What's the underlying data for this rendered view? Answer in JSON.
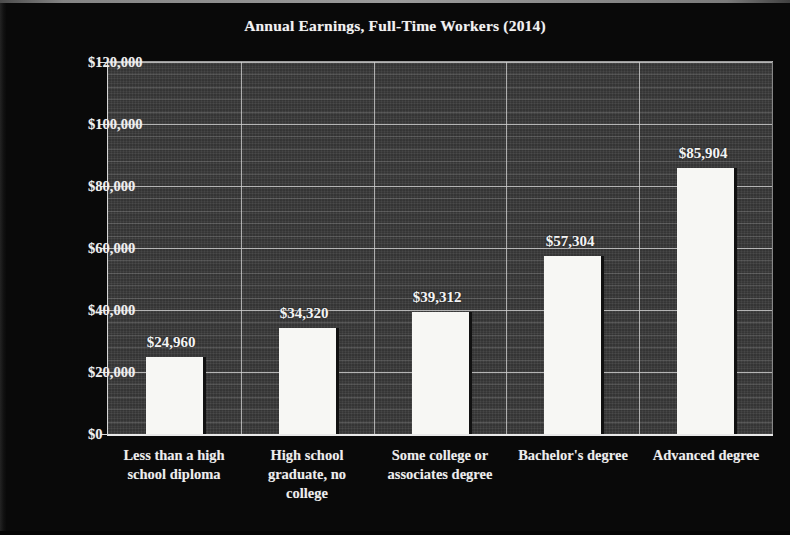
{
  "chart_data": {
    "type": "bar",
    "title": "Annual Earnings, Full-Time Workers (2014)",
    "xlabel": "",
    "ylabel": "",
    "categories": [
      "Less than a high school diploma",
      "High school graduate, no college",
      "Some college or associates degree",
      "Bachelor's degree",
      "Advanced degree"
    ],
    "values": [
      24960,
      34320,
      39312,
      57304,
      85904
    ],
    "data_labels": [
      "$24,960",
      "$34,320",
      "$39,312",
      "$57,304",
      "$85,904"
    ],
    "ylim": [
      0,
      120000
    ],
    "ytick_values": [
      0,
      20000,
      40000,
      60000,
      80000,
      100000,
      120000
    ],
    "ytick_labels": [
      "$0",
      "$20,000",
      "$40,000",
      "$60,000",
      "$80,000",
      "$100,000",
      "$120,000"
    ],
    "grid": true,
    "minor_grid": true,
    "legend": false,
    "legend_position": "none",
    "colors": {
      "background": "#0a0a0a",
      "plot_background": "#3b3b3b",
      "bar_fill": "#f7f7f4",
      "bar_shadow": "#111111",
      "gridline": "#c9c9c9",
      "text": "#f0f0f0"
    }
  },
  "category_label_lines": [
    [
      "Less than a high",
      "school diploma"
    ],
    [
      "High school",
      "graduate, no",
      "college"
    ],
    [
      "Some college or",
      "associates degree"
    ],
    [
      "Bachelor's degree"
    ],
    [
      "Advanced degree"
    ]
  ]
}
